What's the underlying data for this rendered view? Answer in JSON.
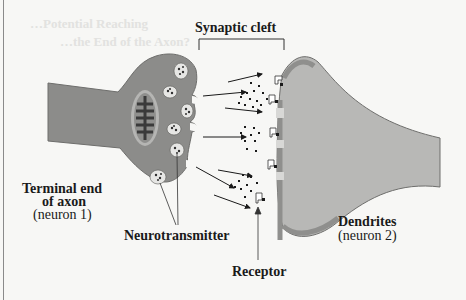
{
  "diagram": {
    "labels": {
      "synaptic_cleft": "Synaptic cleft",
      "terminal_line1": "Terminal end",
      "terminal_line2": "of axon",
      "terminal_line3": "(neuron 1)",
      "neurotransmitter": "Neurotransmitter",
      "receptor": "Receptor",
      "dendrites_line1": "Dendrites",
      "dendrites_line2": "(neuron 2)"
    },
    "bleed_through": {
      "line1": "…Potential Reaching",
      "line2": "…the End of the Axon?"
    },
    "colors": {
      "axon_fill": "#8c8c8a",
      "dendrite_fill": "#b8b8b6",
      "dendrite_edge": "#8f8f8d",
      "background": "#f7f7f5",
      "text": "#1a1a1a"
    }
  }
}
